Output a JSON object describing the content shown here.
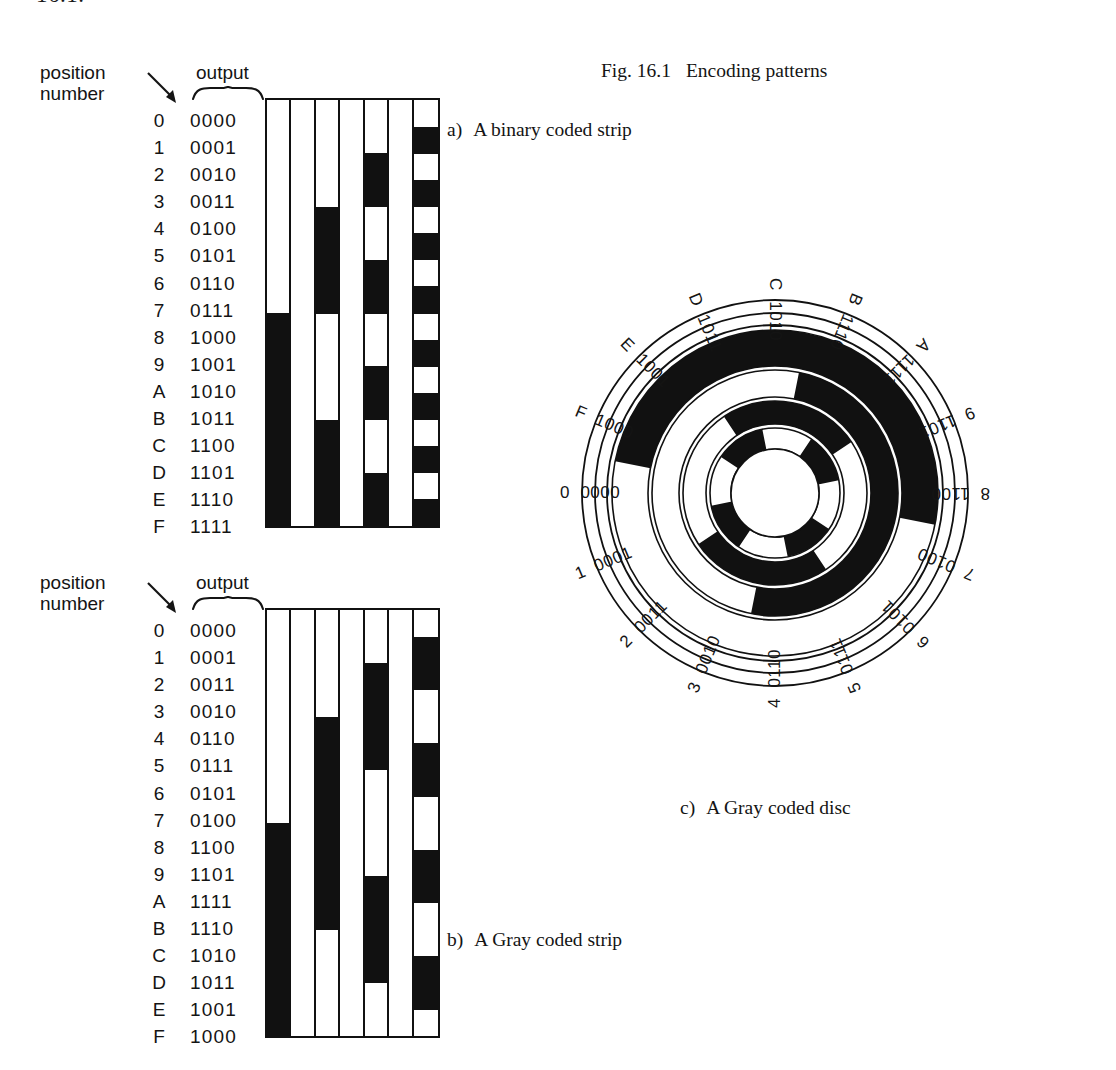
{
  "page_fragment": "16.1.",
  "figure": {
    "number": "Fig. 16.1",
    "title": "Encoding patterns"
  },
  "captions": {
    "a_letter": "a)",
    "a_text": "A binary coded strip",
    "b_letter": "b)",
    "b_text": "A Gray coded strip",
    "c_letter": "c)",
    "c_text": "A Gray coded disc"
  },
  "headers": {
    "position_number": "position\nnumber",
    "output": "output"
  },
  "binary_strip": {
    "rows": [
      {
        "position": "0",
        "code": "0000"
      },
      {
        "position": "1",
        "code": "0001"
      },
      {
        "position": "2",
        "code": "0010"
      },
      {
        "position": "3",
        "code": "0011"
      },
      {
        "position": "4",
        "code": "0100"
      },
      {
        "position": "5",
        "code": "0101"
      },
      {
        "position": "6",
        "code": "0110"
      },
      {
        "position": "7",
        "code": "0111"
      },
      {
        "position": "8",
        "code": "1000"
      },
      {
        "position": "9",
        "code": "1001"
      },
      {
        "position": "A",
        "code": "1010"
      },
      {
        "position": "B",
        "code": "1011"
      },
      {
        "position": "C",
        "code": "1100"
      },
      {
        "position": "D",
        "code": "1101"
      },
      {
        "position": "E",
        "code": "1110"
      },
      {
        "position": "F",
        "code": "1111"
      }
    ]
  },
  "gray_strip": {
    "rows": [
      {
        "position": "0",
        "code": "0000"
      },
      {
        "position": "1",
        "code": "0001"
      },
      {
        "position": "2",
        "code": "0011"
      },
      {
        "position": "3",
        "code": "0010"
      },
      {
        "position": "4",
        "code": "0110"
      },
      {
        "position": "5",
        "code": "0111"
      },
      {
        "position": "6",
        "code": "0101"
      },
      {
        "position": "7",
        "code": "0100"
      },
      {
        "position": "8",
        "code": "1100"
      },
      {
        "position": "9",
        "code": "1101"
      },
      {
        "position": "A",
        "code": "1111"
      },
      {
        "position": "B",
        "code": "1110"
      },
      {
        "position": "C",
        "code": "1010"
      },
      {
        "position": "D",
        "code": "1011"
      },
      {
        "position": "E",
        "code": "1001"
      },
      {
        "position": "F",
        "code": "1000"
      }
    ]
  },
  "disc": {
    "labels": [
      {
        "position": "0",
        "code": "0000"
      },
      {
        "position": "1",
        "code": "0001"
      },
      {
        "position": "2",
        "code": "0011"
      },
      {
        "position": "3",
        "code": "0010"
      },
      {
        "position": "4",
        "code": "0110"
      },
      {
        "position": "5",
        "code": "0111"
      },
      {
        "position": "6",
        "code": "0101"
      },
      {
        "position": "7",
        "code": "0100"
      },
      {
        "position": "8",
        "code": "1100"
      },
      {
        "position": "9",
        "code": "1101"
      },
      {
        "position": "A",
        "code": "1111"
      },
      {
        "position": "B",
        "code": "1110"
      },
      {
        "position": "C",
        "code": "1010"
      },
      {
        "position": "D",
        "code": "1011"
      },
      {
        "position": "E",
        "code": "1001"
      },
      {
        "position": "F",
        "code": "1000"
      }
    ]
  },
  "colors": {
    "ink": "#111111",
    "paper": "#ffffff"
  }
}
